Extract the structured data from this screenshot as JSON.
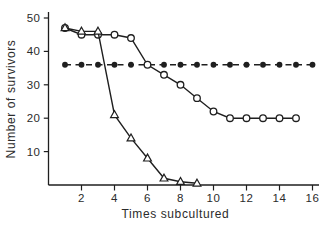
{
  "figure": {
    "background": "#ffffff",
    "ink_color": "#1f1f1f",
    "text_color": "#2b2b2b"
  },
  "chart_data": {
    "type": "line",
    "title": "",
    "xlabel": "Times subcultured",
    "ylabel": "Number of survivors",
    "xlim": [
      0,
      16.6
    ],
    "ylim": [
      0,
      51.5
    ],
    "x_ticks": [
      2,
      4,
      6,
      8,
      10,
      12,
      14,
      16
    ],
    "y_ticks": [
      10,
      20,
      30,
      40,
      50
    ],
    "grid": false,
    "legend": "none",
    "series": [
      {
        "name": "filled-circle-dashed",
        "marker": "filled-circle",
        "line": "dashed",
        "x": [
          1,
          2,
          3,
          4,
          5,
          6,
          7,
          8,
          9,
          10,
          11,
          12,
          13,
          14,
          15,
          16
        ],
        "y": [
          36,
          36,
          36,
          36,
          36,
          36,
          36,
          36,
          36,
          36,
          36,
          36,
          36,
          36,
          36,
          36
        ]
      },
      {
        "name": "open-circle-solid",
        "marker": "open-circle",
        "line": "solid",
        "x": [
          1,
          2,
          3,
          4,
          5,
          6,
          7,
          8,
          9,
          10,
          11,
          12,
          13,
          14,
          15
        ],
        "y": [
          47,
          45,
          45,
          45,
          44,
          36,
          33,
          30,
          26,
          22,
          20,
          20,
          20,
          20,
          20
        ]
      },
      {
        "name": "open-triangle-solid",
        "marker": "open-triangle",
        "line": "solid",
        "x": [
          1,
          2,
          3,
          4,
          5,
          6,
          7,
          8,
          9
        ],
        "y": [
          47,
          46,
          46,
          21,
          14,
          8,
          2,
          1,
          0.5
        ]
      }
    ]
  }
}
